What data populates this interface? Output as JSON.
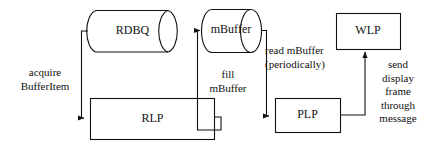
{
  "diagram": {
    "type": "flow-diagram",
    "background_color": "#ffffff",
    "stroke_color": "#111111",
    "nodes": [
      {
        "id": "rdbq",
        "label": "RDBQ",
        "shape": "cylinder"
      },
      {
        "id": "mbuffer",
        "label": "mBuffer",
        "shape": "cylinder"
      },
      {
        "id": "wlp",
        "label": "WLP",
        "shape": "rectangle"
      },
      {
        "id": "rlp",
        "label": "RLP",
        "shape": "rectangle"
      },
      {
        "id": "plp",
        "label": "PLP",
        "shape": "rectangle"
      }
    ],
    "edges": [
      {
        "id": "rdbq-to-rlp",
        "from": "rdbq",
        "to": "rlp",
        "label": "acquire\nBufferItem"
      },
      {
        "id": "rlp-to-mbuffer",
        "from": "rlp",
        "to": "mbuffer",
        "label": "fill\nmBuffer"
      },
      {
        "id": "mbuffer-to-plp",
        "from": "mbuffer",
        "to": "plp",
        "label": "read mBuffer\n(periodically)"
      },
      {
        "id": "plp-to-wlp",
        "from": "plp",
        "to": "wlp",
        "label": "send\ndisplay\nframe\nthrough\nmessage"
      }
    ],
    "labels": {
      "rdbq": "RDBQ",
      "mbuffer": "mBuffer",
      "wlp": "WLP",
      "rlp": "RLP",
      "plp": "PLP",
      "acquire_line1": "acquire",
      "acquire_line2": "BufferItem",
      "fill_line1": "fill",
      "fill_line2": "mBuffer",
      "read_line1": "read mBuffer",
      "read_line2": "(periodically)",
      "send_line1": "send",
      "send_line2": "display",
      "send_line3": "frame",
      "send_line4": "through",
      "send_line5": "message"
    }
  }
}
